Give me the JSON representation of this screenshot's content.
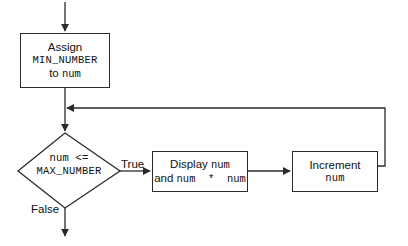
{
  "diagram": {
    "canvas": {
      "width": 408,
      "height": 246,
      "background": "#ffffff"
    },
    "line_color": "#2b2b2b",
    "text_color": "#111111",
    "nodes": {
      "assign": {
        "shape": "process",
        "line1": "Assign",
        "line2": "MIN_NUMBER",
        "line3_prefix": "to ",
        "line3_mono": "num"
      },
      "decision": {
        "shape": "decision",
        "line1": "num <=",
        "line2": "MAX_NUMBER"
      },
      "display": {
        "shape": "process",
        "line1_prefix": "Display ",
        "line1_mono": "num",
        "line2_prefix": "and ",
        "line2_mono": "num  *  num"
      },
      "increment": {
        "shape": "process",
        "line1": "Increment",
        "line2": "num"
      }
    },
    "edges": {
      "true_label": "True",
      "false_label": "False"
    }
  }
}
